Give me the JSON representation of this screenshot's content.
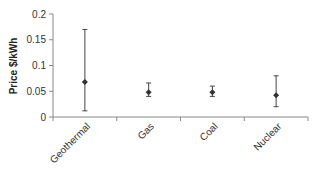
{
  "chart_data": {
    "type": "scatter",
    "title": "",
    "xlabel": "",
    "ylabel": "Price $/kWh",
    "ylim": [
      0,
      0.2
    ],
    "yticks": [
      0,
      0.05,
      0.1,
      0.15,
      0.2
    ],
    "ytick_labels": [
      "0",
      "0.05",
      "0.1",
      "0.15",
      "0.2"
    ],
    "categories": [
      "Geothermal",
      "Gas",
      "Coal",
      "Nuclear"
    ],
    "values": [
      0.068,
      0.048,
      0.048,
      0.042
    ],
    "error_high": [
      0.17,
      0.066,
      0.06,
      0.08
    ],
    "error_low": [
      0.012,
      0.04,
      0.04,
      0.02
    ],
    "grid": false,
    "legend": null,
    "marker": "diamond",
    "color": "#333333"
  }
}
